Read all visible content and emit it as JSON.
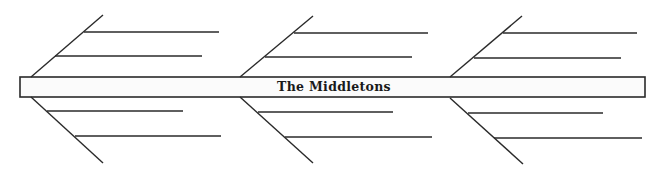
{
  "diagram": {
    "type": "fishbone",
    "title": "The Middletons",
    "colors": {
      "stroke": "#2a2a2a",
      "spine_fill": "#fbfbfb",
      "text": "#1a1a1a",
      "background": "#ffffff"
    },
    "spine": {
      "x": 20,
      "y": 77,
      "width": 625,
      "height": 20
    },
    "groups": [
      {
        "upper_bone": {
          "x1": 31,
          "y1": 77,
          "x2": 103,
          "y2": 15
        },
        "lower_bone": {
          "x1": 31,
          "y1": 97,
          "x2": 103,
          "y2": 163
        },
        "branches": [
          {
            "x1": 84,
            "y1": 32,
            "x2": 219,
            "y2": 32,
            "text": ""
          },
          {
            "x1": 55,
            "y1": 56,
            "x2": 202,
            "y2": 56,
            "text": ""
          },
          {
            "x1": 47,
            "y1": 111,
            "x2": 183,
            "y2": 111,
            "text": ""
          },
          {
            "x1": 75,
            "y1": 136,
            "x2": 221,
            "y2": 136,
            "text": ""
          }
        ]
      },
      {
        "upper_bone": {
          "x1": 240,
          "y1": 77,
          "x2": 313,
          "y2": 16
        },
        "lower_bone": {
          "x1": 240,
          "y1": 97,
          "x2": 313,
          "y2": 163
        },
        "branches": [
          {
            "x1": 294,
            "y1": 33,
            "x2": 428,
            "y2": 33,
            "text": ""
          },
          {
            "x1": 265,
            "y1": 57,
            "x2": 412,
            "y2": 57,
            "text": ""
          },
          {
            "x1": 258,
            "y1": 112,
            "x2": 393,
            "y2": 112,
            "text": ""
          },
          {
            "x1": 285,
            "y1": 137,
            "x2": 432,
            "y2": 137,
            "text": ""
          }
        ]
      },
      {
        "upper_bone": {
          "x1": 450,
          "y1": 77,
          "x2": 522,
          "y2": 16
        },
        "lower_bone": {
          "x1": 450,
          "y1": 98,
          "x2": 523,
          "y2": 164
        },
        "branches": [
          {
            "x1": 503,
            "y1": 33,
            "x2": 637,
            "y2": 33,
            "text": ""
          },
          {
            "x1": 474,
            "y1": 58,
            "x2": 621,
            "y2": 58,
            "text": ""
          },
          {
            "x1": 468,
            "y1": 113,
            "x2": 603,
            "y2": 113,
            "text": ""
          },
          {
            "x1": 494,
            "y1": 138,
            "x2": 642,
            "y2": 138,
            "text": ""
          }
        ]
      }
    ]
  }
}
